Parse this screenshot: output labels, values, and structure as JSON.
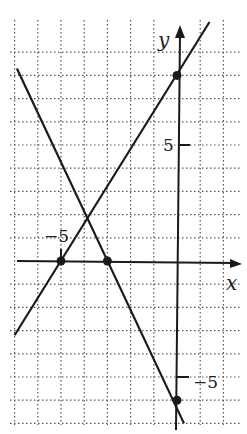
{
  "chart_data": {
    "type": "line",
    "title": "",
    "xlabel": "x",
    "ylabel": "y",
    "grid": true,
    "grid_style": "dotted",
    "tick_labels": {
      "x": [
        {
          "value": -5,
          "label": "−5"
        }
      ],
      "y": [
        {
          "value": 5,
          "label": "5"
        },
        {
          "value": -5,
          "label": "−5"
        }
      ]
    },
    "xlim": [
      -7,
      3
    ],
    "ylim": [
      -7,
      9
    ],
    "series": [
      {
        "name": "line-1",
        "equation": "y = 1.6x + 8",
        "points": [
          {
            "x": -7,
            "y": -3.2
          },
          {
            "x": 1.4,
            "y": 10.3
          }
        ],
        "marked_points": [
          {
            "x": -5,
            "y": 0
          },
          {
            "x": 0,
            "y": 8
          }
        ]
      },
      {
        "name": "line-2",
        "equation": "y = -2x - 6",
        "points": [
          {
            "x": -6.9,
            "y": 8.3
          },
          {
            "x": 0.3,
            "y": -7
          }
        ],
        "marked_points": [
          {
            "x": -3,
            "y": 0
          },
          {
            "x": 0,
            "y": -6
          }
        ]
      }
    ],
    "intersection": {
      "x": -3.89,
      "y": 1.78
    }
  },
  "labels": {
    "x_axis": "x",
    "y_axis": "y",
    "x_tick_neg5": "−5",
    "y_tick_5": "5",
    "y_tick_neg5": "−5"
  },
  "colors": {
    "line": "#1a1a1a",
    "grid": "#555555",
    "background": "#ffffff"
  }
}
